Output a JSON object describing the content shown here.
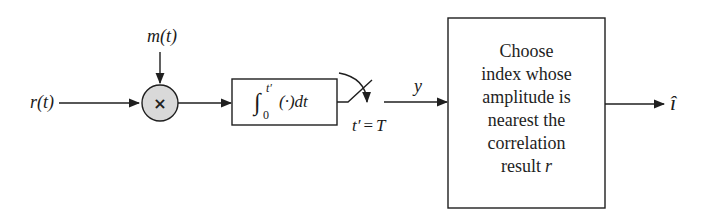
{
  "diagram": {
    "type": "block-diagram",
    "colors": {
      "line": "#1f1f1f",
      "multiplier_fill": "#d9d9d9",
      "background": "#ffffff"
    },
    "inputs": {
      "received_signal": "r(t)",
      "reference_signal": "m(t)"
    },
    "multiplier": {
      "symbol": "×"
    },
    "integrator": {
      "upper_limit": "t′",
      "lower_limit": "0",
      "integrand": "(·)dt"
    },
    "sampler": {
      "label_lhs": "t′",
      "label_eq": "=",
      "label_rhs": "T"
    },
    "sample_output": "y",
    "decision_block": {
      "lines": [
        "Choose",
        "index whose",
        "amplitude is",
        "nearest the",
        "correlation",
        "result"
      ],
      "last_var": "r"
    },
    "output": "î"
  }
}
